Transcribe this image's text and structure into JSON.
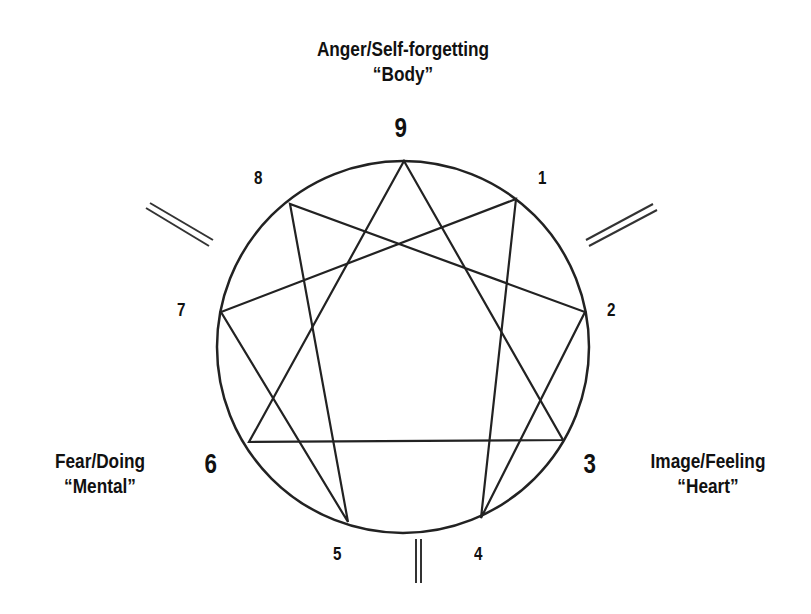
{
  "diagram": {
    "centers": {
      "top": {
        "line1": "Anger/Self-forgetting",
        "line2": "“Body”"
      },
      "left": {
        "line1": "Fear/Doing",
        "line2": "“Mental”"
      },
      "right": {
        "line1": "Image/Feeling",
        "line2": "“Heart”"
      }
    },
    "points": [
      {
        "n": "9",
        "x": 404,
        "y": 161
      },
      {
        "n": "1",
        "x": 516,
        "y": 199
      },
      {
        "n": "2",
        "x": 585,
        "y": 312
      },
      {
        "n": "3",
        "x": 563,
        "y": 440
      },
      {
        "n": "4",
        "x": 481,
        "y": 518
      },
      {
        "n": "5",
        "x": 348,
        "y": 522
      },
      {
        "n": "6",
        "x": 249,
        "y": 442
      },
      {
        "n": "7",
        "x": 221,
        "y": 312
      },
      {
        "n": "8",
        "x": 290,
        "y": 204
      }
    ],
    "circle": {
      "cx": 403,
      "cy": 347,
      "r": 186
    },
    "triangle": [
      "9",
      "3",
      "6"
    ],
    "hexad": [
      "1",
      "4",
      "2",
      "8",
      "5",
      "7"
    ],
    "line_color": "#222222"
  }
}
